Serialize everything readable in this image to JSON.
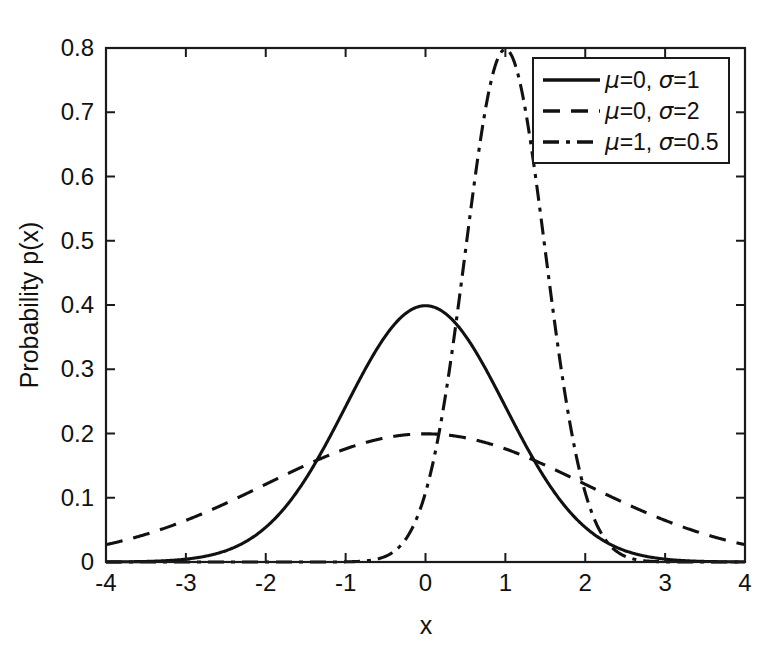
{
  "chart_data": {
    "type": "line",
    "title": "",
    "xlabel": "x",
    "ylabel": "Probability p(x)",
    "xlim": [
      -4,
      4
    ],
    "ylim": [
      0,
      0.8
    ],
    "xticks": [
      "-4",
      "-3",
      "-2",
      "-1",
      "0",
      "1",
      "2",
      "3",
      "4"
    ],
    "xtick_values": [
      -4,
      -3,
      -2,
      -1,
      0,
      1,
      2,
      3,
      4
    ],
    "yticks": [
      "0",
      "0.1",
      "0.2",
      "0.3",
      "0.4",
      "0.5",
      "0.6",
      "0.7",
      "0.8"
    ],
    "ytick_values": [
      0,
      0.1,
      0.2,
      0.3,
      0.4,
      0.5,
      0.6,
      0.7,
      0.8
    ],
    "grid": false,
    "legend_position": "upper right",
    "series": [
      {
        "name": "μ=0, σ=1",
        "mu": 0,
        "sigma": 1,
        "linestyle": "solid",
        "color": "#111111",
        "peak_value": 0.399,
        "x": [
          -4,
          -3.5,
          -3,
          -2.5,
          -2,
          -1.5,
          -1,
          -0.5,
          0,
          0.5,
          1,
          1.5,
          2,
          2.5,
          3,
          3.5,
          4
        ],
        "y": [
          0.0001,
          0.0009,
          0.0044,
          0.0175,
          0.054,
          0.1295,
          0.242,
          0.3521,
          0.3989,
          0.3521,
          0.242,
          0.1295,
          0.054,
          0.0175,
          0.0044,
          0.0009,
          0.0001
        ]
      },
      {
        "name": "μ=0, σ=2",
        "mu": 0,
        "sigma": 2,
        "linestyle": "dashed",
        "color": "#111111",
        "peak_value": 0.199,
        "x": [
          -4,
          -3.5,
          -3,
          -2.5,
          -2,
          -1.5,
          -1,
          -0.5,
          0,
          0.5,
          1,
          1.5,
          2,
          2.5,
          3,
          3.5,
          4
        ],
        "y": [
          0.027,
          0.0431,
          0.0648,
          0.0914,
          0.121,
          0.1506,
          0.176,
          0.1933,
          0.1995,
          0.1933,
          0.176,
          0.1506,
          0.121,
          0.0914,
          0.0648,
          0.0431,
          0.027
        ]
      },
      {
        "name": "μ=1, σ=0.5",
        "mu": 1,
        "sigma": 0.5,
        "linestyle": "dashdot",
        "color": "#111111",
        "peak_value": 0.798,
        "x": [
          -4,
          -3,
          -2,
          -1,
          -0.5,
          0,
          0.25,
          0.5,
          0.75,
          1,
          1.25,
          1.5,
          1.75,
          2,
          2.5,
          3,
          4
        ],
        "y": [
          0,
          0,
          0,
          0.0003,
          0.0089,
          0.108,
          0.2636,
          0.4839,
          0.7041,
          0.7979,
          0.7041,
          0.4839,
          0.2636,
          0.108,
          0.0089,
          0.0003,
          0
        ]
      }
    ]
  },
  "axes": {
    "y_label_text": "Probability p(x)",
    "x_label_text": "x"
  },
  "legend": {
    "entries": [
      {
        "label_mu": "μ=0,",
        "label_sigma": "σ=1",
        "style": "solid"
      },
      {
        "label_mu": "μ=0,",
        "label_sigma": "σ=2",
        "style": "dashed"
      },
      {
        "label_mu": "μ=1,",
        "label_sigma": "σ=0.5",
        "style": "dashdot"
      }
    ]
  }
}
